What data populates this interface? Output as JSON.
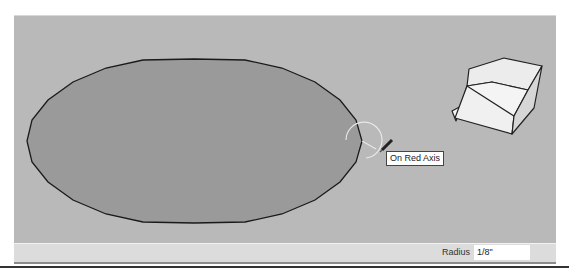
{
  "viewport": {
    "background_color": "#b9b9b9",
    "shapes": {
      "circle_face": {
        "fill": "#9a9a9a",
        "stroke": "#1a1a1a"
      },
      "box": {
        "top_fill": "#ececec",
        "front_fill": "#f4f4f4",
        "side_fill": "#d8d8d8",
        "stroke": "#222222"
      }
    },
    "cursor": {
      "tool": "circle-tool",
      "icon": "pencil-icon"
    },
    "inference_tooltip": "On Red Axis"
  },
  "statusbar": {
    "measurement_label": "Radius",
    "measurement_value": "1/8\""
  }
}
